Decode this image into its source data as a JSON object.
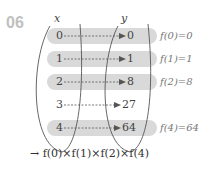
{
  "problem_number": "06",
  "sets": {
    "domain_label": "x",
    "codomain_label": "y"
  },
  "mappings": [
    {
      "x": "0",
      "y": "0",
      "highlight": true,
      "annotation": "f(0)=0"
    },
    {
      "x": "1",
      "y": "1",
      "highlight": true,
      "annotation": "f(1)=1"
    },
    {
      "x": "2",
      "y": "8",
      "highlight": true,
      "annotation": "f(2)=8"
    },
    {
      "x": "3",
      "y": "27",
      "highlight": false,
      "annotation": ""
    },
    {
      "x": "4",
      "y": "64",
      "highlight": true,
      "annotation": "f(4)=64"
    }
  ],
  "result": "→ f(0)×f(1)×f(2)×f(4)",
  "colors": {
    "highlight_band": "#d9d9d9",
    "number_label": "#c0c0c0",
    "line": "#555555"
  }
}
